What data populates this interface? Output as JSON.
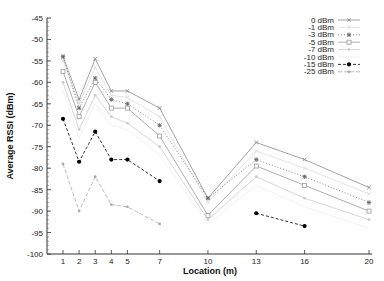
{
  "chart_data": {
    "type": "line",
    "title": "",
    "xlabel": "Location (m)",
    "ylabel": "Average RSSI (dBm)",
    "x": [
      1,
      2,
      3,
      4,
      5,
      7,
      10,
      13,
      16,
      20
    ],
    "x_ticks": [
      "1",
      "2",
      "3",
      "4",
      "5",
      "7",
      "10",
      "13",
      "16",
      "20"
    ],
    "y_ticks": [
      "-45",
      "-50",
      "-55",
      "-60",
      "-65",
      "-70",
      "-75",
      "-80",
      "-85",
      "-90",
      "-95",
      "-100"
    ],
    "ylim": [
      -100,
      -45
    ],
    "xlim": [
      0,
      20
    ],
    "grid": false,
    "legend_position": "top-right",
    "series": [
      {
        "name": "0 dBm",
        "color": "#8a8a8a",
        "marker": "x",
        "dash": "",
        "values": [
          -54,
          -64,
          -54.5,
          -62,
          -62,
          -66,
          -87,
          -74,
          -78,
          -84.5
        ]
      },
      {
        "name": "-1 dBm",
        "color": "#dddddd",
        "marker": "x",
        "dash": "",
        "values": [
          -55,
          -65,
          -56.5,
          -63,
          -63.5,
          -68,
          -88,
          -76,
          -80,
          -86
        ]
      },
      {
        "name": "-3 dBm",
        "color": "#666666",
        "marker": "star",
        "dash": "1,2",
        "values": [
          -54,
          -66,
          -59,
          -64,
          -65,
          -70,
          -87,
          -78,
          -82,
          -88
        ]
      },
      {
        "name": "-5 dBm",
        "color": "#999999",
        "marker": "square",
        "dash": "",
        "values": [
          -57.5,
          -68,
          -60,
          -66,
          -66,
          -72.5,
          -91,
          -79.5,
          -84,
          -90
        ]
      },
      {
        "name": "-7 dBm",
        "color": "#cccccc",
        "marker": "dot",
        "dash": "",
        "values": [
          -60,
          -71,
          -63,
          -68,
          -69.5,
          -75,
          -92,
          -82,
          -87,
          -92
        ]
      },
      {
        "name": "-10 dBm",
        "color": "#eeeeee",
        "marker": "none",
        "dash": "",
        "values": [
          -62,
          -73,
          -65,
          -70,
          -71,
          -77,
          -93,
          -84,
          -89,
          -94
        ]
      },
      {
        "name": "-15 dBm",
        "color": "#000000",
        "marker": "filled-circle",
        "dash": "3,2",
        "values": [
          -68.5,
          -78.5,
          -71.5,
          -78,
          -78,
          -83,
          null,
          -90.5,
          -93.5,
          null
        ]
      },
      {
        "name": "-25 dBm",
        "color": "#aaaaaa",
        "marker": "dot",
        "dash": "4,2",
        "values": [
          -79,
          -90,
          -82,
          -88.5,
          -89,
          -93,
          null,
          null,
          null,
          null
        ]
      }
    ]
  }
}
